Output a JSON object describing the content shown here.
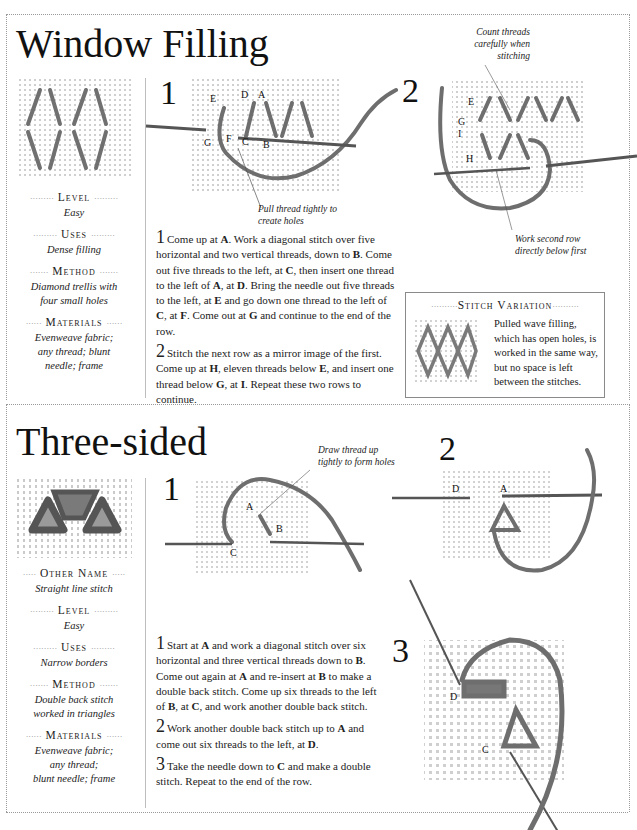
{
  "sections": [
    {
      "title": "Window Filling",
      "sidebar": [
        {
          "label": "Level",
          "value": "Easy"
        },
        {
          "label": "Uses",
          "value": "Dense filling"
        },
        {
          "label": "Method",
          "value_lines": [
            "Diamond trellis with",
            "four small holes"
          ]
        },
        {
          "label": "Materials",
          "value_lines": [
            "Evenweave fabric;",
            "any thread; blunt",
            "needle; frame"
          ]
        }
      ],
      "steps": [
        {
          "number": "1",
          "diagram_labels": [
            "E",
            "D",
            "A",
            "G",
            "F",
            "C",
            "B"
          ],
          "caption_lines": [
            "Pull thread tightly to",
            "create holes"
          ],
          "text": "Come up at A. Work a diagonal stitch over five horizontal and two vertical threads, down to B. Come out five threads to the left, at C, then insert one thread to the left of A, at D. Bring the needle out five threads to the left, at E and go down one thread to the left of C, at F. Come out at G and continue to the end of the row."
        },
        {
          "number": "2",
          "diagram_labels": [
            "E",
            "G",
            "I",
            "H"
          ],
          "caption_top_lines": [
            "Count threads",
            "carefully when",
            "stitching"
          ],
          "caption_lines": [
            "Work second row",
            "directly below first"
          ],
          "text": "Stitch the next row as a mirror image of the first. Come up at H, eleven threads below E, and insert one thread below G, at I. Repeat these two rows to continue."
        }
      ],
      "variation": {
        "heading": "Stitch Variation",
        "text_lines": [
          "Pulled wave filling,",
          "which has open holes, is",
          "worked in the same way,",
          "but no space is left",
          "between the stitches."
        ]
      }
    },
    {
      "title": "Three-sided",
      "sidebar": [
        {
          "label": "Other Name",
          "value": "Straight line stitch"
        },
        {
          "label": "Level",
          "value": "Easy"
        },
        {
          "label": "Uses",
          "value": "Narrow borders"
        },
        {
          "label": "Method",
          "value_lines": [
            "Double back stitch",
            "worked in triangles"
          ]
        },
        {
          "label": "Materials",
          "value_lines": [
            "Evenweave fabric;",
            "any thread;",
            "blunt needle; frame"
          ]
        }
      ],
      "steps": [
        {
          "number": "1",
          "diagram_labels": [
            "A",
            "B",
            "C"
          ],
          "caption_lines": [
            "Draw thread up",
            "tightly to form holes"
          ],
          "text": "Start at A and work a diagonal stitch over six horizontal and three vertical threads down to B. Come out again at A and re-insert at B to make a double back stitch. Come up six threads to the left of B, at C, and work another double back stitch."
        },
        {
          "number": "2",
          "diagram_labels": [
            "D",
            "A"
          ],
          "text": "Work another double back stitch up to A and come out six threads to the left, at D."
        },
        {
          "number": "3",
          "diagram_labels": [
            "D",
            "C"
          ],
          "text": "Take the needle down to C and make a double stitch. Repeat to the end of the row."
        }
      ]
    }
  ],
  "colors": {
    "thread": "#7a7a7a",
    "fabric_dot": "#c8c8c8",
    "rule": "#9a9a9a"
  }
}
